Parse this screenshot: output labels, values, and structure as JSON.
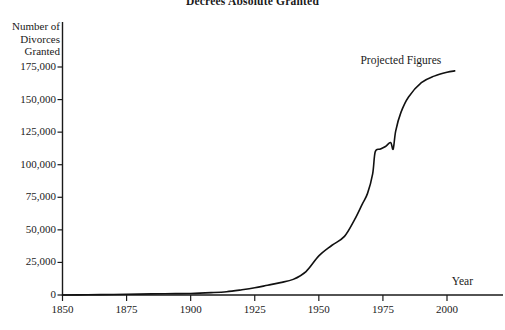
{
  "chart_data": {
    "type": "line",
    "title": "Decrees Absolute Granted",
    "xlabel": "Year",
    "ylabel": "Number of\nDivorces\nGranted",
    "xlim": [
      1850,
      2010
    ],
    "ylim": [
      0,
      185000
    ],
    "grid": false,
    "legend": "none",
    "xticks": [
      1850,
      1875,
      1900,
      1925,
      1950,
      1975,
      2000
    ],
    "xtick_labels": [
      "1850",
      "1875",
      "1900",
      "1925",
      "1950",
      "1975",
      "2000"
    ],
    "yticks": [
      0,
      25000,
      50000,
      75000,
      100000,
      125000,
      150000,
      175000
    ],
    "ytick_labels": [
      "0",
      "25,000",
      "50,000",
      "75,000",
      "100,000",
      "125,000",
      "150,000",
      "175,000"
    ],
    "annotations": [
      {
        "text": "Projected Figures",
        "x": 1982,
        "y": 180000
      },
      {
        "text": "Year",
        "x": 2006,
        "y": 11000
      }
    ],
    "series": [
      {
        "name": "Decrees Absolute Granted",
        "color": "#111111",
        "x": [
          1850,
          1860,
          1870,
          1880,
          1890,
          1900,
          1908,
          1914,
          1920,
          1925,
          1930,
          1935,
          1940,
          1945,
          1950,
          1955,
          1960,
          1964,
          1967,
          1969,
          1971,
          1972,
          1974,
          1976,
          1978,
          1979,
          1980,
          1982,
          1985,
          1990,
          1995,
          2000,
          2003
        ],
        "values": [
          0,
          200,
          400,
          700,
          1000,
          1200,
          1800,
          2500,
          4000,
          5500,
          7500,
          9500,
          12000,
          18000,
          30000,
          38000,
          45000,
          58000,
          70000,
          78000,
          93000,
          110000,
          112000,
          114000,
          117000,
          112000,
          126000,
          140000,
          152000,
          163000,
          168000,
          171000,
          172000
        ]
      }
    ]
  }
}
